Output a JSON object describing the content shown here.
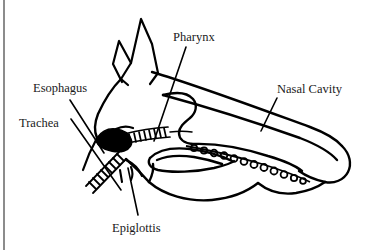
{
  "figure": {
    "background_color": "#ffffff",
    "ink_color": "#000000",
    "margin_rule_color": "#8c8c8c"
  },
  "labels": {
    "esophagus": "Esophagus",
    "trachea": "Trachea",
    "pharynx": "Pharynx",
    "nasal_cavity": "Nasal Cavity",
    "epiglottis": "Epiglottis"
  },
  "structures": [
    {
      "name": "esophagus",
      "label": "Esophagus"
    },
    {
      "name": "trachea",
      "label": "Trachea"
    },
    {
      "name": "pharynx",
      "label": "Pharynx"
    },
    {
      "name": "nasal-cavity",
      "label": "Nasal Cavity"
    },
    {
      "name": "epiglottis",
      "label": "Epiglottis"
    }
  ]
}
